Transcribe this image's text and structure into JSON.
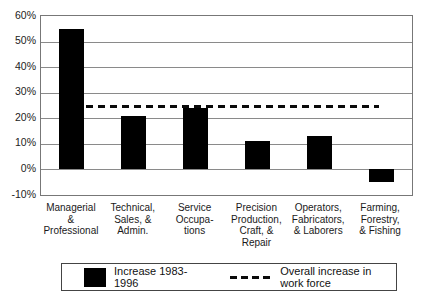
{
  "colors": {
    "bar": "#000000",
    "grid": "#8a8a8a",
    "text": "#1a1a1a",
    "background": "#ffffff"
  },
  "chart_data": {
    "type": "bar",
    "title": "",
    "xlabel": "",
    "ylabel": "",
    "ylim": [
      -10,
      60
    ],
    "grid": true,
    "yticks": [
      {
        "value": 60,
        "label": "60%"
      },
      {
        "value": 50,
        "label": "50%"
      },
      {
        "value": 40,
        "label": "40%"
      },
      {
        "value": 30,
        "label": "30%"
      },
      {
        "value": 20,
        "label": "20%"
      },
      {
        "value": 10,
        "label": "10%"
      },
      {
        "value": 0,
        "label": "0%"
      },
      {
        "value": -10,
        "label": "-10%"
      }
    ],
    "categories": [
      "Managerial\n&\nProfessional",
      "Technical,\nSales, &\nAdmin.",
      "Service\nOccupa-\ntions",
      "Precision\nProduction,\nCraft, &\nRepair",
      "Operators,\nFabricators,\n& Laborers",
      "Farming,\nForestry,\n& Fishing"
    ],
    "values": [
      55,
      21,
      24,
      11,
      13,
      -5
    ],
    "overall_increase_line": 25,
    "legend": [
      {
        "marker": "black-square",
        "label": "Increase 1983-1996"
      },
      {
        "marker": "dashed-line",
        "label": "Overall increase in work force"
      }
    ],
    "legend_position": "bottom"
  }
}
